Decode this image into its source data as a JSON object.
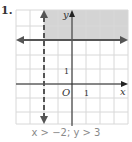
{
  "problem": {
    "number": "1.",
    "caption": "x > −2; y > 3"
  },
  "graph": {
    "x_axis_label": "x",
    "y_axis_label": "y",
    "origin_label": "O",
    "x_tick_label": "1",
    "y_tick_label": "1",
    "xlim": [
      -4,
      4
    ],
    "ylim": [
      -3,
      5
    ],
    "boundary_lines": [
      {
        "equation": "x = -2",
        "style": "dashed"
      },
      {
        "equation": "y = 3",
        "style": "solid"
      }
    ],
    "shaded_region": "x > -2 and y > 3",
    "colors": {
      "shade": "#d4d4d4",
      "grid": "#d8d8d8",
      "lines": "#555555",
      "axis": "#222222"
    }
  }
}
